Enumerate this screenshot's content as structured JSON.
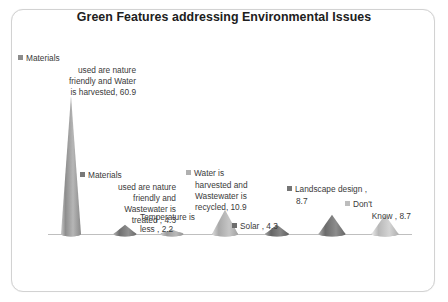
{
  "chart_data": {
    "type": "bar",
    "title": "Green Features addressing Environmental Issues",
    "subtitle": "",
    "xlabel": "",
    "ylabel": "",
    "ylim": [
      0,
      65
    ],
    "grid": false,
    "legend_position": "none",
    "axis_line_color": "#bfbfbf",
    "marker_style": "3d-cone",
    "categories": [
      "Materials used are nature friendly and Water is harvested",
      "Materials used are nature friendly and Wastewater is treated",
      "Temperature is less",
      "Water is harvested and Wastewater is recycled",
      "Solar",
      "Landscape design",
      "Don't Know"
    ],
    "values": [
      60.9,
      4.3,
      2.2,
      10.9,
      4.3,
      8.7,
      8.7
    ],
    "point_colors": [
      "#9b9b9b",
      "#7d7d7d",
      "#a8a8a8",
      "#b4b4b4",
      "#6f6f6f",
      "#777777",
      "#c2c2c2"
    ],
    "data_labels": [
      {
        "key_color": "#8c8c8c",
        "first_line": "Materials",
        "body": "used are nature\nfriendly and Water\nis harvested, 60.9",
        "full_text": "Materials used are nature friendly and Water is harvested, 60.9",
        "value": 60.9
      },
      {
        "key_color": "#787878",
        "first_line": "Materials",
        "body": "used are nature\nfriendly and\nWastewater is\ntreated , 4.3",
        "full_text": "Materials used are nature friendly and Wastewater is treated , 4.3",
        "value": 4.3
      },
      {
        "key_color": "#a5a5a5",
        "first_line": "Temperature is",
        "body": "less , 2.2",
        "full_text": "Temperature is less , 2.2",
        "value": 2.2
      },
      {
        "key_color": "#b0b0b0",
        "first_line": "Water is",
        "body": "harvested and\nWastewater is\nrecycled, 10.9",
        "full_text": "Water is harvested and Wastewater is recycled, 10.9",
        "value": 10.9
      },
      {
        "key_color": "#6d6d6d",
        "first_line": "Solar , 4.3",
        "body": "",
        "full_text": "Solar , 4.3",
        "value": 4.3
      },
      {
        "key_color": "#757575",
        "first_line": "Landscape design ,",
        "body": "8.7",
        "full_text": "Landscape design , 8.7",
        "value": 8.7
      },
      {
        "key_color": "#bdbdbd",
        "first_line": "Don't",
        "body": "Know , 8.7",
        "full_text": "Don't Know , 8.7",
        "value": 8.7
      }
    ]
  },
  "slide": {
    "title": "Green Features addressing Environmental Issues",
    "border_color": "#d2d2d2",
    "background": "#ffffff"
  }
}
